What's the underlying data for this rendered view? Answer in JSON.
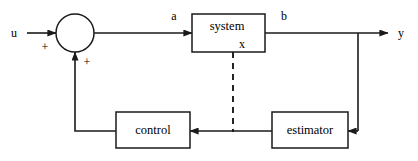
{
  "diagram": {
    "colors": {
      "line": "#1a1a1a",
      "text": "#000000",
      "background": "#ffffff"
    },
    "signals": {
      "input": "u",
      "plant_input": "a",
      "plant_output": "b",
      "system_output": "y",
      "state": "x"
    },
    "signs": {
      "input_sign": "+",
      "feedback_sign": "+"
    },
    "blocks": [
      {
        "id": "system",
        "label": "system"
      },
      {
        "id": "control",
        "label": "control"
      },
      {
        "id": "estimator",
        "label": "estimator"
      }
    ],
    "junction": {
      "name": "summing-junction",
      "shape": "circle"
    }
  }
}
